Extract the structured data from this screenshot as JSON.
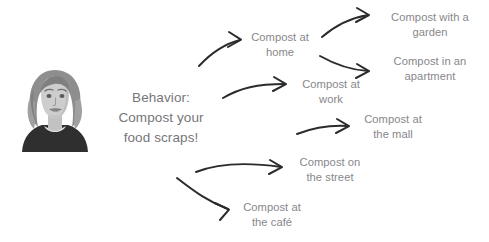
{
  "canvas": {
    "width": 489,
    "height": 242,
    "background": "#ffffff"
  },
  "colors": {
    "node_text": "#87878b",
    "behavior_text": "#76767a",
    "arrow": "#2b2b2d",
    "hair_dark": "#8e8e8e",
    "hair_mid": "#a6a6a6",
    "skin": "#c9c9c9",
    "shirt": "#2f2f2f"
  },
  "avatar": {
    "alt": "illustration of a woman with wavy shoulder-length hair wearing a dark top"
  },
  "behavior": {
    "lines": [
      "Behavior:",
      "Compost your",
      "food scraps!"
    ],
    "line1": "Behavior:",
    "line2": "Compost your",
    "line3": "food scraps!"
  },
  "nodes": {
    "home": {
      "line1": "Compost at",
      "line2": "home"
    },
    "garden": {
      "line1": "Compost with a",
      "line2": "garden"
    },
    "apartment": {
      "line1": "Compost in an",
      "line2": "apartment"
    },
    "work": {
      "line1": "Compost at",
      "line2": "work"
    },
    "mall": {
      "line1": "Compost at",
      "line2": "the mall"
    },
    "street": {
      "line1": "Compost on",
      "line2": "the street"
    },
    "cafe": {
      "line1": "Compost at",
      "line2": "the café"
    }
  },
  "arrows": [
    {
      "name": "arrow-behavior-to-home",
      "from": "behavior",
      "to": "home"
    },
    {
      "name": "arrow-behavior-to-work",
      "from": "behavior",
      "to": "work"
    },
    {
      "name": "arrow-behavior-to-mall",
      "from": "behavior",
      "to": "mall"
    },
    {
      "name": "arrow-behavior-to-street",
      "from": "behavior",
      "to": "street"
    },
    {
      "name": "arrow-behavior-to-cafe",
      "from": "behavior",
      "to": "cafe"
    },
    {
      "name": "arrow-home-to-garden",
      "from": "home",
      "to": "garden"
    },
    {
      "name": "arrow-home-to-apartment",
      "from": "home",
      "to": "apartment"
    }
  ]
}
